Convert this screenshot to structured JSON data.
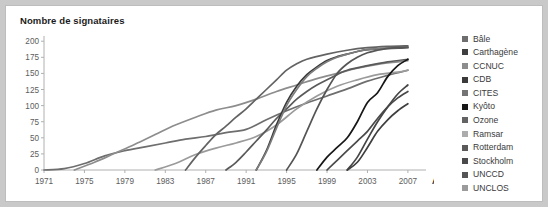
{
  "title": "Nombre de signataires",
  "axis": {
    "x_label": "Année",
    "y_ticks": [
      "0",
      "25",
      "50",
      "75",
      "100",
      "125",
      "150",
      "175",
      "200"
    ],
    "x_ticks": [
      "1971",
      "1975",
      "1979",
      "1983",
      "1987",
      "1991",
      "1995",
      "1999",
      "2003",
      "2007"
    ]
  },
  "legend": {
    "items": [
      {
        "label": "Bâle",
        "color": "#6e6e6e"
      },
      {
        "label": "Carthagène",
        "color": "#3f3f3f"
      },
      {
        "label": "CCNUC",
        "color": "#8d8d8d"
      },
      {
        "label": "CDB",
        "color": "#3a3a3a"
      },
      {
        "label": "CITES",
        "color": "#747474"
      },
      {
        "label": "Kyôto",
        "color": "#171717"
      },
      {
        "label": "Ozone",
        "color": "#636363"
      },
      {
        "label": "Ramsar",
        "color": "#acacac"
      },
      {
        "label": "Rotterdam",
        "color": "#5a5a5a"
      },
      {
        "label": "Stockholm",
        "color": "#4a4a4a"
      },
      {
        "label": "UNCCD",
        "color": "#555555"
      },
      {
        "label": "UNCLOS",
        "color": "#9b9b9b"
      }
    ]
  },
  "chart_data": {
    "type": "line",
    "title": "Nombre de signataires",
    "xlabel": "Année",
    "ylabel": "Nombre de signataires",
    "xlim": [
      1971,
      2008
    ],
    "ylim": [
      0,
      205
    ],
    "grid": false,
    "legend_position": "right",
    "x_ticks": [
      1971,
      1975,
      1979,
      1983,
      1987,
      1991,
      1995,
      1999,
      2003,
      2007
    ],
    "y_ticks": [
      0,
      25,
      50,
      75,
      100,
      125,
      150,
      175,
      200
    ],
    "series": [
      {
        "name": "Ramsar",
        "color": "#6e6e6e",
        "points": [
          [
            1971,
            0
          ],
          [
            1973,
            2
          ],
          [
            1975,
            10
          ],
          [
            1977,
            22
          ],
          [
            1979,
            30
          ],
          [
            1981,
            36
          ],
          [
            1983,
            42
          ],
          [
            1985,
            48
          ],
          [
            1987,
            52
          ],
          [
            1989,
            58
          ],
          [
            1991,
            63
          ],
          [
            1993,
            78
          ],
          [
            1995,
            92
          ],
          [
            1997,
            104
          ],
          [
            1999,
            115
          ],
          [
            2001,
            126
          ],
          [
            2003,
            138
          ],
          [
            2005,
            147
          ],
          [
            2007,
            155
          ]
        ]
      },
      {
        "name": "CITES",
        "color": "#8d8d8d",
        "points": [
          [
            1974,
            0
          ],
          [
            1976,
            12
          ],
          [
            1978,
            26
          ],
          [
            1980,
            40
          ],
          [
            1982,
            55
          ],
          [
            1984,
            70
          ],
          [
            1986,
            82
          ],
          [
            1988,
            93
          ],
          [
            1990,
            100
          ],
          [
            1992,
            110
          ],
          [
            1994,
            122
          ],
          [
            1996,
            132
          ],
          [
            1998,
            142
          ],
          [
            2000,
            150
          ],
          [
            2002,
            158
          ],
          [
            2004,
            164
          ],
          [
            2006,
            168
          ],
          [
            2007,
            170
          ]
        ]
      },
      {
        "name": "UNCLOS",
        "color": "#9b9b9b",
        "points": [
          [
            1982,
            0
          ],
          [
            1984,
            10
          ],
          [
            1986,
            24
          ],
          [
            1988,
            34
          ],
          [
            1990,
            42
          ],
          [
            1992,
            52
          ],
          [
            1994,
            70
          ],
          [
            1996,
            95
          ],
          [
            1998,
            115
          ],
          [
            2000,
            130
          ],
          [
            2002,
            140
          ],
          [
            2004,
            148
          ],
          [
            2006,
            152
          ],
          [
            2007,
            155
          ]
        ]
      },
      {
        "name": "Ozone",
        "color": "#636363",
        "points": [
          [
            1985,
            0
          ],
          [
            1986,
            20
          ],
          [
            1987,
            38
          ],
          [
            1988,
            55
          ],
          [
            1989,
            68
          ],
          [
            1990,
            82
          ],
          [
            1991,
            95
          ],
          [
            1992,
            110
          ],
          [
            1993,
            125
          ],
          [
            1994,
            140
          ],
          [
            1995,
            155
          ],
          [
            1996,
            165
          ],
          [
            1997,
            172
          ],
          [
            1999,
            180
          ],
          [
            2001,
            186
          ],
          [
            2003,
            190
          ],
          [
            2005,
            192
          ],
          [
            2007,
            193
          ]
        ]
      },
      {
        "name": "Bâle",
        "color": "#5a5a5a",
        "points": [
          [
            1989,
            0
          ],
          [
            1990,
            12
          ],
          [
            1991,
            28
          ],
          [
            1992,
            45
          ],
          [
            1993,
            62
          ],
          [
            1994,
            80
          ],
          [
            1995,
            95
          ],
          [
            1996,
            110
          ],
          [
            1997,
            122
          ],
          [
            1998,
            132
          ],
          [
            1999,
            140
          ],
          [
            2000,
            148
          ],
          [
            2001,
            155
          ],
          [
            2003,
            162
          ],
          [
            2005,
            168
          ],
          [
            2007,
            172
          ]
        ]
      },
      {
        "name": "CDB",
        "color": "#3a3a3a",
        "points": [
          [
            1992,
            0
          ],
          [
            1993,
            30
          ],
          [
            1994,
            70
          ],
          [
            1995,
            105
          ],
          [
            1996,
            130
          ],
          [
            1997,
            148
          ],
          [
            1998,
            160
          ],
          [
            1999,
            170
          ],
          [
            2000,
            176
          ],
          [
            2001,
            180
          ],
          [
            2002,
            184
          ],
          [
            2003,
            187
          ],
          [
            2005,
            189
          ],
          [
            2007,
            190
          ]
        ]
      },
      {
        "name": "CCNUC",
        "color": "#7d7d7d",
        "points": [
          [
            1992,
            0
          ],
          [
            1993,
            28
          ],
          [
            1994,
            65
          ],
          [
            1995,
            100
          ],
          [
            1996,
            125
          ],
          [
            1997,
            145
          ],
          [
            1998,
            158
          ],
          [
            1999,
            168
          ],
          [
            2000,
            175
          ],
          [
            2001,
            180
          ],
          [
            2002,
            184
          ],
          [
            2003,
            187
          ],
          [
            2005,
            189
          ],
          [
            2007,
            191
          ]
        ]
      },
      {
        "name": "UNCCD",
        "color": "#555555",
        "points": [
          [
            1995,
            0
          ],
          [
            1996,
            25
          ],
          [
            1997,
            60
          ],
          [
            1998,
            95
          ],
          [
            1999,
            125
          ],
          [
            2000,
            150
          ],
          [
            2001,
            165
          ],
          [
            2002,
            175
          ],
          [
            2003,
            182
          ],
          [
            2004,
            186
          ],
          [
            2005,
            189
          ],
          [
            2006,
            190
          ],
          [
            2007,
            191
          ]
        ]
      },
      {
        "name": "Kyôto",
        "color": "#171717",
        "points": [
          [
            1998,
            0
          ],
          [
            1999,
            20
          ],
          [
            2000,
            35
          ],
          [
            2001,
            50
          ],
          [
            2002,
            75
          ],
          [
            2003,
            105
          ],
          [
            2004,
            120
          ],
          [
            2005,
            145
          ],
          [
            2006,
            162
          ],
          [
            2007,
            172
          ]
        ]
      },
      {
        "name": "Rotterdam",
        "color": "#4a4a4a",
        "points": [
          [
            1999,
            0
          ],
          [
            2000,
            15
          ],
          [
            2001,
            30
          ],
          [
            2002,
            45
          ],
          [
            2003,
            60
          ],
          [
            2004,
            80
          ],
          [
            2005,
            98
          ],
          [
            2006,
            112
          ],
          [
            2007,
            122
          ]
        ]
      },
      {
        "name": "Stockholm",
        "color": "#464646",
        "points": [
          [
            2001,
            0
          ],
          [
            2002,
            20
          ],
          [
            2003,
            48
          ],
          [
            2004,
            75
          ],
          [
            2005,
            98
          ],
          [
            2006,
            118
          ],
          [
            2007,
            132
          ]
        ]
      },
      {
        "name": "Carthagène",
        "color": "#3f3f3f",
        "points": [
          [
            2001,
            0
          ],
          [
            2002,
            12
          ],
          [
            2003,
            35
          ],
          [
            2004,
            60
          ],
          [
            2005,
            78
          ],
          [
            2006,
            92
          ],
          [
            2007,
            103
          ]
        ]
      }
    ]
  }
}
